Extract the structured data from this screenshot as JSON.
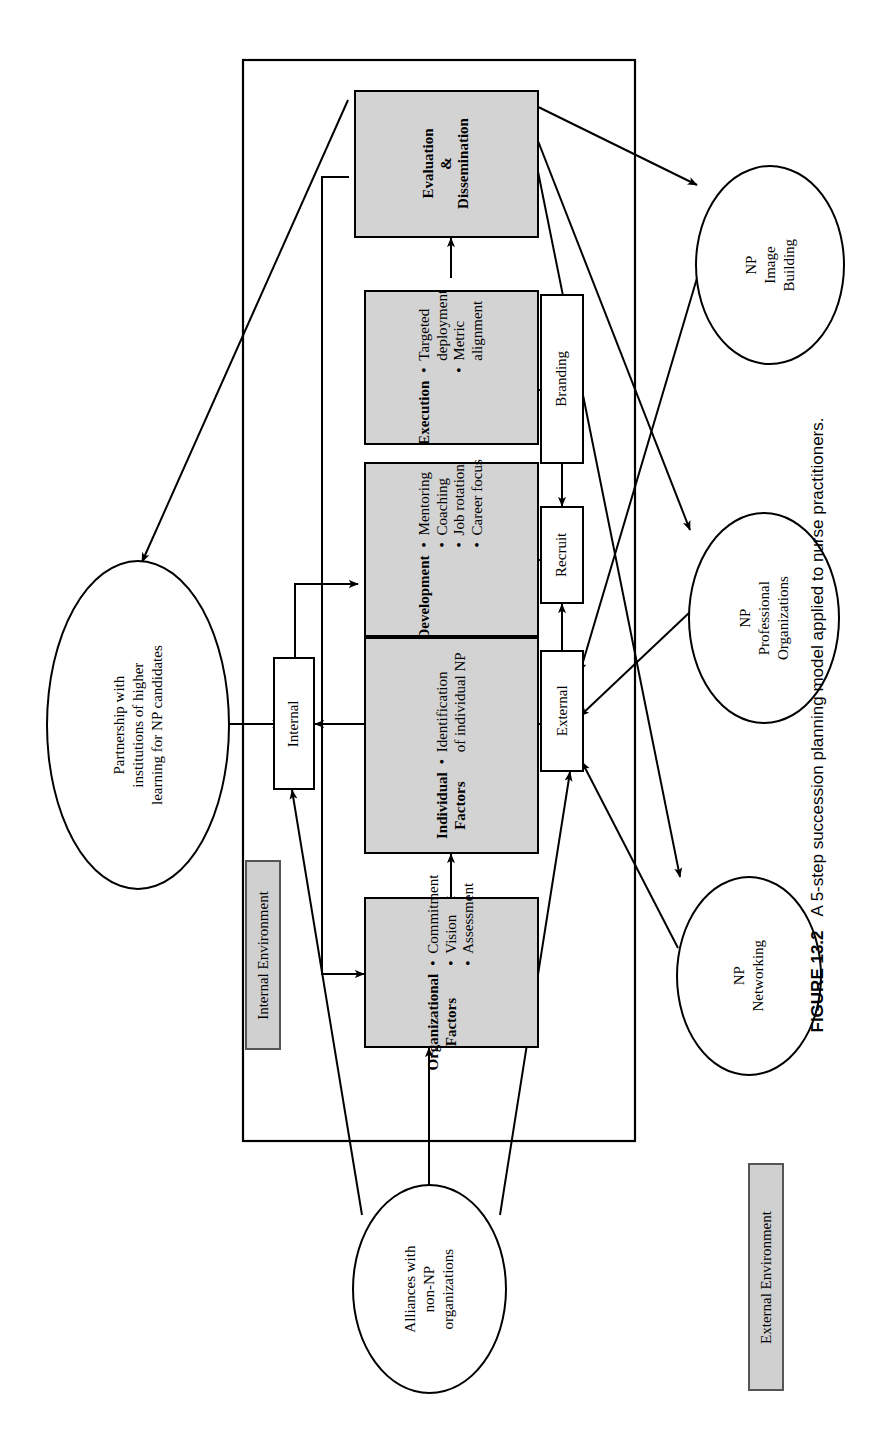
{
  "figure": {
    "number": "FIGURE 13.2",
    "caption": "A 5-step succession planning model applied to nurse practitioners."
  },
  "diagram": {
    "type": "flowchart",
    "orientation": "rotated-90-ccw",
    "boundary_label": "internal-environment-boundary",
    "stages": [
      {
        "id": "organizational-factors",
        "title": "Organizational\nFactors",
        "title_lines": [
          "Organizational",
          "Factors"
        ],
        "bullets": [
          "Commitment",
          "Vision",
          "Assessment"
        ],
        "fill": "#d3d3d3",
        "shape": "rect"
      },
      {
        "id": "individual-factors",
        "title": "Individual\nFactors",
        "title_lines": [
          "Individual",
          "Factors"
        ],
        "bullets": [
          "Identification\nof individual NP"
        ],
        "bullet_lines": [
          [
            "Identification",
            "of individual NP"
          ]
        ],
        "fill": "#d3d3d3",
        "shape": "rect"
      },
      {
        "id": "development",
        "title": "Development",
        "title_lines": [
          "Development"
        ],
        "bullets": [
          "Mentoring",
          "Coaching",
          "Job rotation",
          "Career focus"
        ],
        "fill": "#d3d3d3",
        "shape": "rect"
      },
      {
        "id": "execution",
        "title": "Execution",
        "title_lines": [
          "Execution"
        ],
        "bullets": [
          "Targeted\ndeployment",
          "Metric\nalignment"
        ],
        "bullet_lines": [
          [
            "Targeted",
            "deployment"
          ],
          [
            "Metric",
            "alignment"
          ]
        ],
        "fill": "#d3d3d3",
        "shape": "rect"
      },
      {
        "id": "evaluation-dissemination",
        "title": "Evaluation\n&\nDissemination",
        "title_lines": [
          "Evaluation",
          "&",
          "Dissemination"
        ],
        "bullets": [],
        "fill": "#d3d3d3",
        "shape": "rect"
      }
    ],
    "channels": [
      {
        "id": "internal",
        "label": "Internal",
        "fill": "#ffffff"
      },
      {
        "id": "external",
        "label": "External",
        "fill": "#ffffff"
      },
      {
        "id": "recruit",
        "label": "Recruit",
        "fill": "#ffffff"
      },
      {
        "id": "branding",
        "label": "Branding",
        "fill": "#ffffff"
      }
    ],
    "externals": [
      {
        "id": "partnership-higher-learning",
        "lines": [
          "Partnership with",
          "institutions of higher",
          "learning for NP candidates"
        ]
      },
      {
        "id": "np-image-building",
        "lines": [
          "NP",
          "Image",
          "Building"
        ]
      },
      {
        "id": "np-professional-organizations",
        "lines": [
          "NP",
          "Professional",
          "Organizations"
        ]
      },
      {
        "id": "np-networking",
        "lines": [
          "NP",
          "Networking"
        ]
      },
      {
        "id": "alliances-non-np",
        "lines": [
          "Alliances with",
          "non-NP",
          "organizations"
        ]
      }
    ],
    "legend": [
      {
        "id": "internal-environment",
        "label": "Internal Environment",
        "fill": "#d0d0d0"
      },
      {
        "id": "external-environment",
        "label": "External Environment",
        "fill": "#d0d0d0"
      }
    ],
    "colors": {
      "shaded_fill": "#d3d3d3",
      "plain_fill": "#ffffff",
      "stroke": "#000000",
      "legend_fill": "#d0d0d0"
    }
  }
}
